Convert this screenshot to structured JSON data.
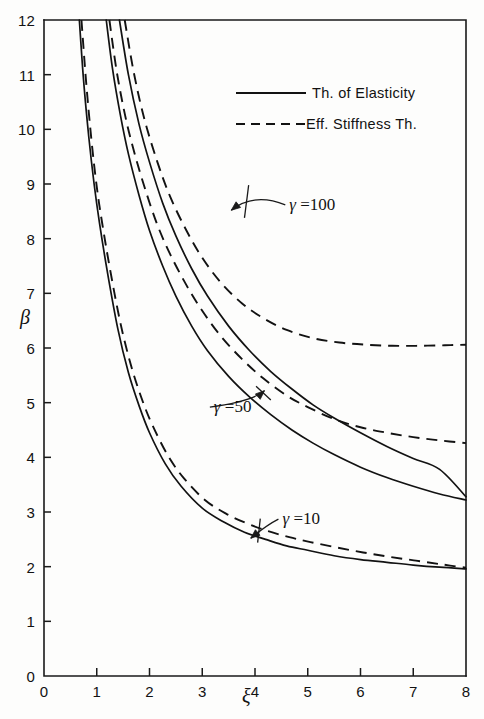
{
  "chart_data": {
    "type": "line",
    "title": "",
    "xlabel": "ξ",
    "ylabel": "β",
    "xlim": [
      0,
      8
    ],
    "ylim": [
      0,
      12
    ],
    "xticks": [
      0,
      1,
      2,
      3,
      4,
      5,
      6,
      7,
      8
    ],
    "xtick_labels": [
      "0",
      "1",
      "2",
      "3",
      "4",
      "5",
      "6",
      "7",
      "8"
    ],
    "yticks": [
      0,
      1,
      2,
      3,
      4,
      5,
      6,
      7,
      8,
      9,
      10,
      11,
      12
    ],
    "ytick_labels": [
      "0",
      "1",
      "2",
      "3",
      "4",
      "5",
      "6",
      "7",
      "8",
      "9",
      "10",
      "11",
      "12"
    ],
    "grid": false,
    "legend_position": "upper-right",
    "legend": [
      {
        "label": "Th. of Elasticity",
        "style": "solid"
      },
      {
        "label": "Eff. Stiffness Th.",
        "style": "dashed"
      }
    ],
    "annotations": [
      {
        "text": "γ =100",
        "gamma": 100,
        "x": 4.65,
        "y": 8.62
      },
      {
        "text": "γ =50",
        "gamma": 50,
        "x": 3.22,
        "y": 4.92
      },
      {
        "text": "γ =10",
        "gamma": 10,
        "x": 4.52,
        "y": 2.87
      }
    ],
    "series": [
      {
        "name": "γ =10, Th. of Elasticity",
        "gamma": 10,
        "style": "solid",
        "x": [
          0.67,
          0.75,
          0.85,
          0.95,
          1.05,
          1.2,
          1.4,
          1.6,
          1.8,
          2.0,
          2.3,
          2.6,
          3.0,
          3.4,
          3.8,
          4.2,
          4.6,
          5.0,
          5.5,
          6.0,
          6.5,
          7.0,
          7.5,
          8.0
        ],
        "y": [
          12.0,
          10.9,
          9.85,
          9.0,
          8.3,
          7.4,
          6.35,
          5.55,
          4.95,
          4.45,
          3.88,
          3.47,
          3.07,
          2.82,
          2.63,
          2.5,
          2.38,
          2.3,
          2.2,
          2.13,
          2.08,
          2.03,
          1.99,
          1.96
        ]
      },
      {
        "name": "γ =10, Eff. Stiffness Th.",
        "gamma": 10,
        "style": "dashed",
        "x": [
          0.71,
          0.8,
          0.9,
          1.0,
          1.1,
          1.25,
          1.45,
          1.65,
          1.85,
          2.05,
          2.35,
          2.65,
          3.05,
          3.45,
          3.85,
          4.25,
          4.65,
          5.05,
          5.55,
          6.05,
          6.55,
          7.05,
          7.55,
          8.0
        ],
        "y": [
          12.0,
          10.85,
          9.8,
          8.95,
          8.3,
          7.45,
          6.45,
          5.68,
          5.08,
          4.6,
          4.03,
          3.62,
          3.22,
          2.97,
          2.79,
          2.65,
          2.54,
          2.45,
          2.35,
          2.26,
          2.18,
          2.11,
          2.04,
          1.98
        ]
      },
      {
        "name": "γ =50, Th. of Elasticity",
        "gamma": 50,
        "style": "solid",
        "x": [
          1.18,
          1.3,
          1.45,
          1.6,
          1.8,
          2.0,
          2.25,
          2.5,
          2.8,
          3.1,
          3.5,
          3.9,
          4.3,
          4.7,
          5.1,
          5.5,
          6.0,
          6.5,
          7.0,
          7.5,
          8.0
        ],
        "y": [
          12.0,
          11.1,
          10.25,
          9.55,
          8.8,
          8.15,
          7.5,
          6.95,
          6.4,
          5.95,
          5.48,
          5.1,
          4.78,
          4.5,
          4.26,
          4.05,
          3.82,
          3.63,
          3.47,
          3.33,
          3.22
        ]
      },
      {
        "name": "γ =50, Eff. Stiffness Th.",
        "gamma": 50,
        "style": "dashed",
        "x": [
          1.24,
          1.38,
          1.55,
          1.72,
          1.92,
          2.15,
          2.4,
          2.7,
          3.0,
          3.35,
          3.75,
          4.15,
          4.6,
          5.0,
          5.5,
          6.0,
          6.5,
          7.0,
          7.5,
          8.0
        ],
        "y": [
          12.0,
          11.05,
          10.2,
          9.55,
          8.9,
          8.25,
          7.7,
          7.15,
          6.68,
          6.22,
          5.8,
          5.45,
          5.13,
          4.92,
          4.7,
          4.55,
          4.45,
          4.37,
          4.31,
          4.26
        ]
      },
      {
        "name": "γ =100, Th. of Elasticity",
        "gamma": 100,
        "style": "solid",
        "x": [
          1.43,
          1.6,
          1.8,
          2.0,
          2.25,
          2.5,
          2.8,
          3.1,
          3.5,
          3.9,
          4.3,
          4.7,
          5.1,
          5.5,
          6.0,
          6.5,
          7.0,
          7.5,
          8.0
        ],
        "y": [
          12.0,
          11.0,
          10.1,
          9.4,
          8.65,
          8.05,
          7.45,
          6.95,
          6.4,
          5.95,
          5.57,
          5.25,
          4.96,
          4.72,
          4.45,
          4.2,
          3.98,
          3.78,
          3.28
        ]
      },
      {
        "name": "γ =100, Eff. Stiffness Th.",
        "gamma": 100,
        "style": "dashed",
        "x": [
          1.53,
          1.7,
          1.9,
          2.15,
          2.4,
          2.7,
          3.0,
          3.35,
          3.75,
          4.15,
          4.6,
          5.1,
          5.6,
          6.1,
          6.6,
          7.1,
          7.6,
          8.0
        ],
        "y": [
          12.0,
          11.05,
          10.2,
          9.4,
          8.75,
          8.15,
          7.65,
          7.2,
          6.82,
          6.55,
          6.33,
          6.18,
          6.1,
          6.06,
          6.04,
          6.04,
          6.05,
          6.06
        ]
      }
    ]
  },
  "plot_box": {
    "left": 44,
    "right": 466,
    "top": 20,
    "bottom": 676
  },
  "legend_block": {
    "sample_x1": 236,
    "sample_x2": 306,
    "text_x": 312,
    "row1_y": 93,
    "row2_y": 124
  }
}
